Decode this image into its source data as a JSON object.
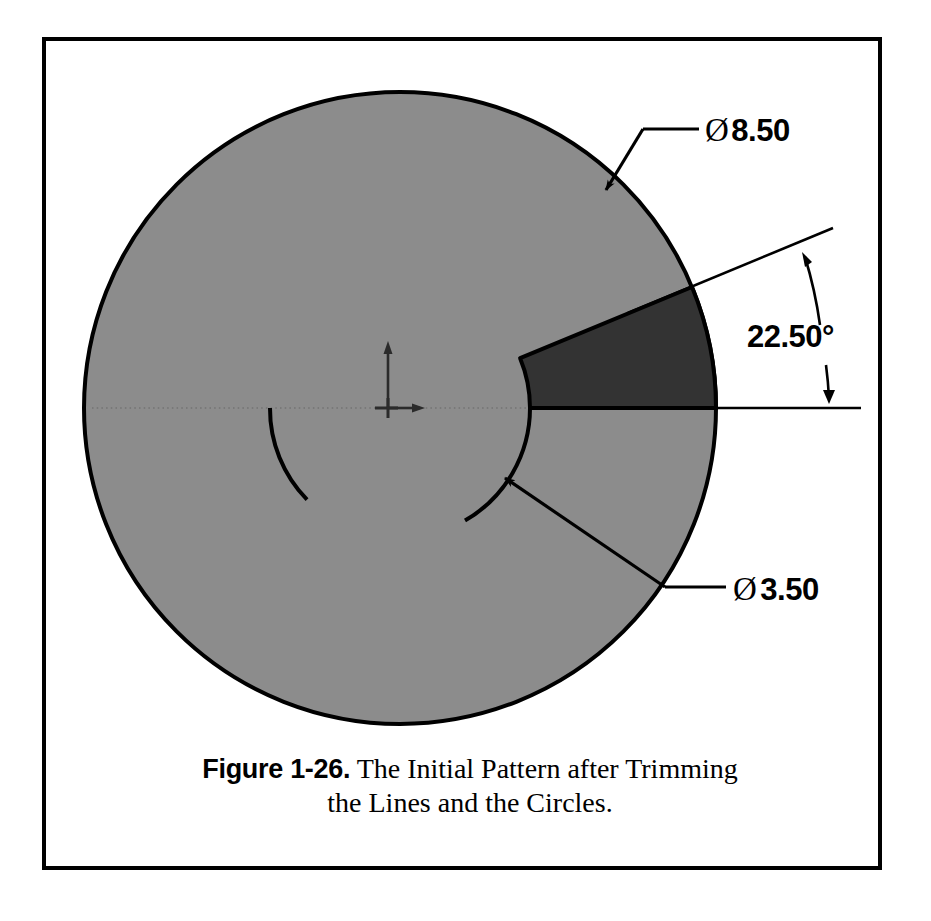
{
  "figure": {
    "caption_label": "Figure 1-26.",
    "caption_text": "The Initial Pattern after Trimming",
    "caption_text_line2": "the Lines and the Circles."
  },
  "drawing": {
    "title": "Initial Pattern after trimming",
    "origin_marker": "origin-axes",
    "colors": {
      "body_fill": "#8c8c8c",
      "wedge_fill": "#333333",
      "outline": "#000000",
      "page_background": "#ffffff",
      "frame_border": "#000000"
    },
    "geometry": {
      "center_x": 400,
      "center_y": 408,
      "outer_radius_px": 316,
      "inner_radius_px": 130,
      "wedge_start_angle_deg": 0,
      "wedge_end_angle_deg": 22.5
    },
    "dimensions": [
      {
        "id": "outer-diameter",
        "symbol": "Ø",
        "value": "8.50",
        "label": "Ø8.50",
        "kind": "diameter",
        "leader_target": "outer-circle-arc"
      },
      {
        "id": "inner-diameter",
        "symbol": "Ø",
        "value": "3.50",
        "label": "Ø3.50",
        "kind": "diameter",
        "leader_target": "inner-circle-arc"
      },
      {
        "id": "wedge-angle",
        "symbol": "",
        "value": "22.50°",
        "label": "22.50°",
        "kind": "angle",
        "leader_target": "wedge-radial-lines"
      }
    ]
  }
}
